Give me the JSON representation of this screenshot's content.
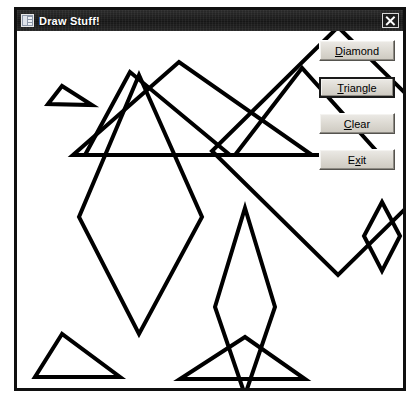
{
  "window": {
    "title": "Draw Stuff!",
    "icon": "application-icon",
    "close_icon": "close-icon",
    "close_label": "X"
  },
  "buttons": [
    {
      "id": "diamond",
      "label": "Diamond",
      "mnemonic": "D",
      "focused": false
    },
    {
      "id": "triangle",
      "label": "Triangle",
      "mnemonic": "T",
      "focused": true
    },
    {
      "id": "clear",
      "label": "Clear",
      "mnemonic": "C",
      "focused": false
    },
    {
      "id": "exit",
      "label": "Exit",
      "mnemonic": "x",
      "focused": false
    }
  ],
  "canvas": {
    "background": "#ffffff",
    "stroke_color": "#000000",
    "stroke_width": 4,
    "shapes": [
      {
        "name": "triangle-top-left",
        "type": "triangle",
        "points": "31,73 45,55 75,74"
      },
      {
        "name": "triangle-upper-middle",
        "type": "triangle",
        "points": "113,41 68,124 213,124"
      },
      {
        "name": "triangle-upper-right",
        "type": "triangle",
        "points": "162,31 56,124 295,124"
      },
      {
        "name": "triangle-right",
        "type": "triangle",
        "points": "285,37 218,124 363,124"
      },
      {
        "name": "triangle-bottom-left",
        "type": "triangle",
        "points": "45,303 18,346 103,346"
      },
      {
        "name": "triangle-bottom-mid",
        "type": "triangle",
        "points": "228,306 163,348 288,348"
      },
      {
        "name": "diamond-large-left",
        "type": "diamond",
        "points": "122,44 185,186 122,303 62,186"
      },
      {
        "name": "diamond-narrow-mid",
        "type": "diamond",
        "points": "228,177 258,276 228,364 198,276"
      },
      {
        "name": "diamond-large-right",
        "type": "diamond",
        "points": "321,-4 447,120 321,244 195,120"
      },
      {
        "name": "diamond-small-right",
        "type": "diamond",
        "points": "365,171 383,205 365,240 347,205"
      }
    ]
  }
}
